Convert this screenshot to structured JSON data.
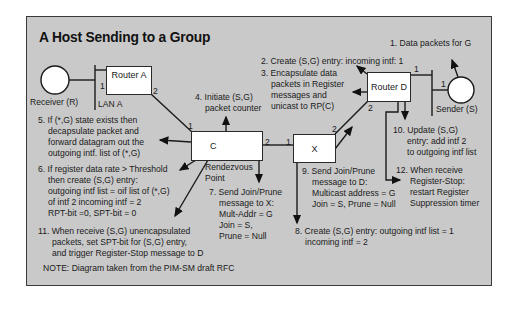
{
  "title": "A Host Sending to a Group",
  "nodes": {
    "receiver": "Receiver (R)",
    "lan_a": "LAN A",
    "router_a": "Router A",
    "router_d": "Router D",
    "sender": "Sender (S)",
    "c": "C",
    "x": "X",
    "rp": [
      "Rendezvous",
      "Point"
    ]
  },
  "ports": {
    "a_lan": "1",
    "a_out": "2",
    "c_in": "1",
    "c_out": "2",
    "x_in": "1",
    "x_out": "2",
    "d_lan": "1",
    "d_out": "2",
    "s_lan": "1"
  },
  "steps": {
    "s1": [
      "1. Data packets for G"
    ],
    "s2": [
      "2. Create (S,G) entry: incoming intf:  1"
    ],
    "s3": [
      "3. Encapsulate data",
      "packets in Register",
      "messages and",
      "unicast to RP(C)"
    ],
    "s4": [
      "4. Initiate (S,G)",
      "packet counter"
    ],
    "s5": [
      "5. If (*,G) state exists then",
      "decapsulate packet  and",
      "forward datagram out the",
      "outgoing intf.  list of (*,G)"
    ],
    "s6": [
      "6. If register data rate > Threshold",
      "then create (S,G) entry:",
      "outgoing intf list = oif list of (*,G)",
      "of intf 2 incoming intf = 2",
      "RPT-bit =0, SPT-bit = 0"
    ],
    "s7": [
      "7. Send Join/Prune",
      "message to X:",
      "Mult-Addr = G",
      "Join = S,",
      "Prune = Null"
    ],
    "s8": [
      "8. Create (S,G) entry: outgoing intf list = 1",
      "incoming intf = 2"
    ],
    "s9": [
      "9. Send Join/Prune",
      "message to D:",
      "Multicast address = G",
      "Join = S, Prune = Null"
    ],
    "s10": [
      "10. Update (S,G)",
      "entry: add intf 2",
      "to outgoing intf list"
    ],
    "s11": [
      "11. When receive (S,G) unencapsulated",
      "packets, set SPT-bit for (S,G) entry,",
      "and trigger Register-Stop message to D"
    ],
    "s12": [
      "12. When receive",
      "Register-Stop:",
      "restart Register",
      "Suppression timer"
    ]
  },
  "note": "NOTE: Diagram taken from the PIM-SM draft RFC"
}
